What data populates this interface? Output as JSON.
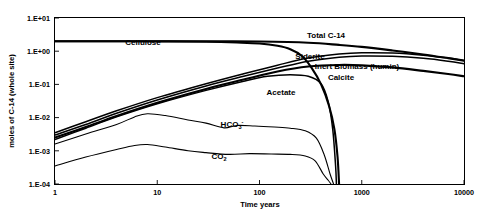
{
  "chart_data": {
    "type": "line",
    "title": "",
    "xlabel": "Time years",
    "ylabel": "moles of C-14 (whole site)",
    "xscale": "log",
    "yscale": "log",
    "xlim": [
      1,
      10000
    ],
    "ylim": [
      0.0001,
      10
    ],
    "xticks": [
      "1",
      "10",
      "100",
      "1000",
      "10000"
    ],
    "yticks": [
      "1.E+01",
      "1.E+00",
      "1.E-01",
      "1.E-02",
      "1.E-03",
      "1.E-04"
    ],
    "grid": false,
    "legend": "inline-labels",
    "series": [
      {
        "name": "Cellulose",
        "label": "Cellulose",
        "style": "thick",
        "points": [
          [
            1,
            2.0
          ],
          [
            3,
            2.0
          ],
          [
            10,
            1.98
          ],
          [
            30,
            1.92
          ],
          [
            60,
            1.82
          ],
          [
            100,
            1.7
          ],
          [
            150,
            1.45
          ],
          [
            200,
            1.15
          ],
          [
            260,
            0.72
          ],
          [
            320,
            0.33
          ],
          [
            400,
            0.1
          ],
          [
            480,
            0.022
          ],
          [
            540,
            0.0045
          ],
          [
            580,
            0.00065
          ],
          [
            600,
            0.0001
          ]
        ]
      },
      {
        "name": "Total C-14",
        "label": "Total C-14",
        "style": "thick",
        "points": [
          [
            1,
            2.0
          ],
          [
            3,
            2.0
          ],
          [
            10,
            2.0
          ],
          [
            30,
            1.99
          ],
          [
            100,
            1.95
          ],
          [
            300,
            1.8
          ],
          [
            600,
            1.55
          ],
          [
            1000,
            1.35
          ],
          [
            2000,
            1.05
          ],
          [
            4000,
            0.8
          ],
          [
            7000,
            0.62
          ],
          [
            10000,
            0.52
          ]
        ]
      },
      {
        "name": "Siderite",
        "label": "Siderite",
        "style": "medium",
        "points": [
          [
            1,
            0.0035
          ],
          [
            2,
            0.0075
          ],
          [
            4,
            0.016
          ],
          [
            10,
            0.04
          ],
          [
            30,
            0.105
          ],
          [
            70,
            0.21
          ],
          [
            150,
            0.38
          ],
          [
            300,
            0.62
          ],
          [
            600,
            0.82
          ],
          [
            1000,
            0.9
          ],
          [
            2000,
            0.88
          ],
          [
            4000,
            0.76
          ],
          [
            7000,
            0.62
          ],
          [
            10000,
            0.52
          ]
        ]
      },
      {
        "name": "Inert Biomass (humin)",
        "label": "Inert Biomass (humin)",
        "style": "medium",
        "points": [
          [
            1,
            0.003
          ],
          [
            2,
            0.0062
          ],
          [
            4,
            0.0135
          ],
          [
            10,
            0.034
          ],
          [
            30,
            0.09
          ],
          [
            70,
            0.175
          ],
          [
            150,
            0.31
          ],
          [
            300,
            0.5
          ],
          [
            600,
            0.66
          ],
          [
            1000,
            0.72
          ],
          [
            2000,
            0.7
          ],
          [
            4000,
            0.61
          ],
          [
            7000,
            0.5
          ],
          [
            10000,
            0.42
          ]
        ]
      },
      {
        "name": "Calcite",
        "label": "Calcite",
        "style": "thick",
        "points": [
          [
            1,
            0.0025
          ],
          [
            2,
            0.0052
          ],
          [
            4,
            0.0112
          ],
          [
            10,
            0.028
          ],
          [
            30,
            0.073
          ],
          [
            70,
            0.14
          ],
          [
            150,
            0.245
          ],
          [
            300,
            0.345
          ],
          [
            600,
            0.385
          ],
          [
            1000,
            0.375
          ],
          [
            2000,
            0.325
          ],
          [
            4000,
            0.255
          ],
          [
            7000,
            0.205
          ],
          [
            10000,
            0.175
          ]
        ]
      },
      {
        "name": "Acetate",
        "label": "Acetate",
        "style": "medium",
        "points": [
          [
            1,
            0.0022
          ],
          [
            2,
            0.0048
          ],
          [
            4,
            0.0105
          ],
          [
            10,
            0.026
          ],
          [
            30,
            0.066
          ],
          [
            70,
            0.125
          ],
          [
            120,
            0.175
          ],
          [
            200,
            0.195
          ],
          [
            300,
            0.175
          ],
          [
            400,
            0.105
          ],
          [
            470,
            0.03
          ],
          [
            520,
            0.0045
          ],
          [
            555,
            0.00035
          ],
          [
            565,
            0.0001
          ]
        ]
      },
      {
        "name": "HCO3-",
        "label": "HCO3-",
        "style": "thin",
        "points": [
          [
            1,
            0.0016
          ],
          [
            2,
            0.0032
          ],
          [
            4,
            0.0062
          ],
          [
            6,
            0.0105
          ],
          [
            8,
            0.013
          ],
          [
            12,
            0.0115
          ],
          [
            20,
            0.0085
          ],
          [
            30,
            0.0068
          ],
          [
            45,
            0.0049
          ],
          [
            60,
            0.0058
          ],
          [
            90,
            0.0056
          ],
          [
            140,
            0.0052
          ],
          [
            200,
            0.0048
          ],
          [
            280,
            0.004
          ],
          [
            360,
            0.0024
          ],
          [
            430,
            0.00075
          ],
          [
            490,
            0.0002
          ],
          [
            530,
            0.0001
          ]
        ]
      },
      {
        "name": "CO2",
        "label": "CO2",
        "style": "thin",
        "points": [
          [
            1,
            0.00035
          ],
          [
            2,
            0.00065
          ],
          [
            4,
            0.0011
          ],
          [
            6,
            0.00145
          ],
          [
            8,
            0.00155
          ],
          [
            12,
            0.0013
          ],
          [
            20,
            0.001
          ],
          [
            30,
            0.00088
          ],
          [
            50,
            0.00078
          ],
          [
            80,
            0.00082
          ],
          [
            130,
            0.0008
          ],
          [
            200,
            0.00078
          ],
          [
            280,
            0.0007
          ],
          [
            350,
            0.0005
          ],
          [
            420,
            0.0002
          ],
          [
            470,
            0.00013
          ],
          [
            500,
            0.0001
          ]
        ]
      }
    ],
    "annotations": [
      {
        "name": "Cellulose",
        "text": "Cellulose",
        "x_px": 143,
        "y_px": 45,
        "anchor": "middle"
      },
      {
        "name": "Total C-14",
        "text": "Total C-14",
        "x_px": 326,
        "y_px": 38,
        "anchor": "middle"
      },
      {
        "name": "Siderite",
        "text": "Siderite",
        "x_px": 310,
        "y_px": 59,
        "anchor": "middle"
      },
      {
        "name": "Inert Biomass (humin)",
        "text": "Inert Biomass (humin)",
        "x_px": 357,
        "y_px": 69,
        "anchor": "middle"
      },
      {
        "name": "Calcite",
        "text": "Calcite",
        "x_px": 341,
        "y_px": 80,
        "anchor": "middle"
      },
      {
        "name": "Acetate",
        "text": "Acetate",
        "x_px": 281,
        "y_px": 95,
        "anchor": "middle"
      },
      {
        "name": "CO2",
        "text": "CO2",
        "x_px": 223,
        "y_px": 159,
        "anchor": "middle"
      }
    ],
    "hco3_label": {
      "base": "HCO",
      "sub": "3",
      "sup": "-",
      "x_px": 232,
      "y_px": 127
    },
    "co2_label": {
      "base": "CO",
      "sub": "2",
      "x_px": 218,
      "y_px": 159
    }
  }
}
